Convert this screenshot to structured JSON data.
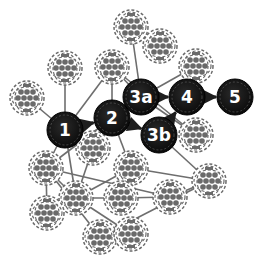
{
  "diagram": {
    "colors": {
      "gray_edge": "#6e6e6e",
      "dark_edge": "#1e1e1e",
      "gray_node_fill": "#ffffff",
      "gray_node_pattern": "#6a6a6a",
      "dark_node_fill": "#141414",
      "label": "#ffffff"
    },
    "gray_nodes": [
      {
        "id": "g1",
        "x": 131,
        "y": 27
      },
      {
        "id": "g2",
        "x": 160,
        "y": 46
      },
      {
        "id": "g3",
        "x": 65,
        "y": 68
      },
      {
        "id": "g4",
        "x": 112,
        "y": 67
      },
      {
        "id": "g5",
        "x": 196,
        "y": 66
      },
      {
        "id": "g6",
        "x": 27,
        "y": 98
      },
      {
        "id": "g7",
        "x": 196,
        "y": 135
      },
      {
        "id": "g8",
        "x": 93,
        "y": 148
      },
      {
        "id": "g9",
        "x": 46,
        "y": 168
      },
      {
        "id": "g10",
        "x": 131,
        "y": 168
      },
      {
        "id": "g11",
        "x": 76,
        "y": 198
      },
      {
        "id": "g12",
        "x": 121,
        "y": 198
      },
      {
        "id": "g13",
        "x": 170,
        "y": 197
      },
      {
        "id": "g14",
        "x": 209,
        "y": 181
      },
      {
        "id": "g15",
        "x": 47,
        "y": 213
      },
      {
        "id": "g16",
        "x": 100,
        "y": 237
      },
      {
        "id": "g17",
        "x": 131,
        "y": 234
      }
    ],
    "path_nodes": [
      {
        "id": "n1",
        "label": "1",
        "x": 65,
        "y": 130
      },
      {
        "id": "n2",
        "label": "2",
        "x": 112,
        "y": 118
      },
      {
        "id": "n3a",
        "label": "3a",
        "x": 141,
        "y": 97
      },
      {
        "id": "n3b",
        "label": "3b",
        "x": 159,
        "y": 135
      },
      {
        "id": "n4",
        "label": "4",
        "x": 187,
        "y": 97
      },
      {
        "id": "n5",
        "label": "5",
        "x": 235,
        "y": 97
      }
    ],
    "gray_edges": [
      [
        "g3",
        "n1"
      ],
      [
        "g6",
        "n1"
      ],
      [
        "g4",
        "n1"
      ],
      [
        "g4",
        "n2"
      ],
      [
        "g4",
        "n3a"
      ],
      [
        "g4",
        "g7"
      ],
      [
        "g1",
        "n3a"
      ],
      [
        "g5",
        "n3a"
      ],
      [
        "n3a",
        "g7"
      ],
      [
        "n1",
        "g9"
      ],
      [
        "n1",
        "g11"
      ],
      [
        "n2",
        "g10"
      ],
      [
        "g8",
        "g11"
      ],
      [
        "g9",
        "g15"
      ],
      [
        "g9",
        "g11"
      ],
      [
        "g9",
        "g13"
      ],
      [
        "g11",
        "g10"
      ],
      [
        "g11",
        "g12"
      ],
      [
        "g11",
        "g17"
      ],
      [
        "g12",
        "g13"
      ],
      [
        "g13",
        "g14"
      ],
      [
        "g10",
        "g14"
      ],
      [
        "n3b",
        "g14"
      ],
      [
        "g16",
        "g14"
      ],
      [
        "g9",
        "g16"
      ],
      [
        "n2",
        "g9"
      ]
    ],
    "path_edges": [
      [
        "n1",
        "n2"
      ],
      [
        "n2",
        "n3a"
      ],
      [
        "n2",
        "n3b"
      ],
      [
        "n3a",
        "n4"
      ],
      [
        "n3b",
        "n4"
      ],
      [
        "n4",
        "n5"
      ]
    ]
  }
}
